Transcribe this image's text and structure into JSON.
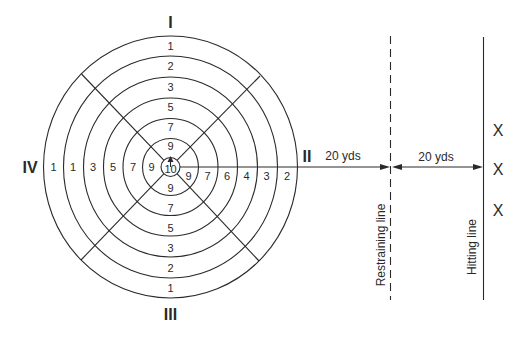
{
  "target": {
    "center": [
      170.5,
      167
    ],
    "rings_rx": [
      9.5,
      28,
      47.5,
      67,
      87,
      107,
      127
    ],
    "rings_ry": [
      9.5,
      28.5,
      48.5,
      69,
      90,
      111,
      131
    ],
    "center_value": "10",
    "quadrants": {
      "top": {
        "label": "I",
        "values": [
          "1",
          "2",
          "3",
          "5",
          "7",
          "9"
        ]
      },
      "right": {
        "label": "II",
        "values": [
          "2",
          "3",
          "4",
          "6",
          "7",
          "9"
        ]
      },
      "bottom": {
        "label": "III",
        "values": [
          "9",
          "7",
          "5",
          "3",
          "2",
          "1"
        ]
      },
      "left": {
        "label": "IV",
        "values": [
          "1",
          "1",
          "3",
          "5",
          "7",
          "9"
        ]
      }
    }
  },
  "distances": {
    "target_to_restraining": "20 yds",
    "restraining_to_hitting": "20 yds"
  },
  "lines": {
    "restraining": {
      "label": "Restraining line",
      "style": "dashed"
    },
    "hitting": {
      "label": "Hitting line",
      "style": "solid"
    }
  },
  "hitting_positions": {
    "marks": [
      "X",
      "X",
      "X"
    ]
  },
  "colors": {
    "ink": "#2a2a2a",
    "background": "#ffffff"
  }
}
